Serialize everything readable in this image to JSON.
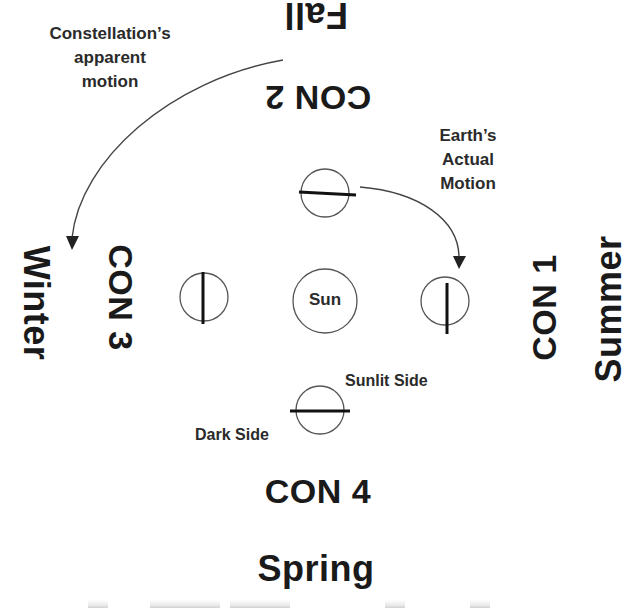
{
  "diagram": {
    "seasons": {
      "top": "Fall",
      "left": "Winter",
      "right": "Summer",
      "bottom": "Spring"
    },
    "constellations": {
      "top": "CON 2",
      "left": "CON 3",
      "right": "CON 1",
      "bottom": "CON 4"
    },
    "center_label": "Sun",
    "annotations": {
      "constellation_motion": [
        "Constellation’s",
        "apparent",
        "motion"
      ],
      "earth_motion": [
        "Earth’s",
        "Actual",
        "Motion"
      ],
      "sunlit_side": "Sunlit Side",
      "dark_side": "Dark Side"
    },
    "earth_positions": [
      {
        "position": "top",
        "terminator": "horizontal"
      },
      {
        "position": "left",
        "terminator": "vertical"
      },
      {
        "position": "right",
        "terminator": "vertical"
      },
      {
        "position": "bottom",
        "terminator": "horizontal"
      }
    ],
    "colors": {
      "ink": "#1a1a1a",
      "line": "#555555",
      "background": "#ffffff"
    }
  }
}
